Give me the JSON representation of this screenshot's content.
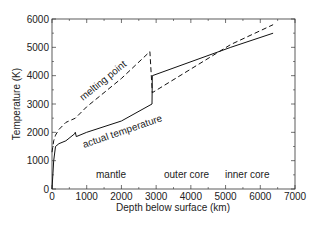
{
  "chart_data": {
    "type": "line",
    "title": "",
    "xlabel": "Depth below surface (km)",
    "ylabel": "Temperature (K)",
    "xlim": [
      0,
      7000
    ],
    "ylim": [
      0,
      6000
    ],
    "xticks": [
      0,
      1000,
      2000,
      3000,
      4000,
      5000,
      6000,
      7000
    ],
    "yticks": [
      0,
      1000,
      2000,
      3000,
      4000,
      5000,
      6000
    ],
    "grid": false,
    "legend": "none",
    "series": [
      {
        "name": "melting point",
        "style": "dashed",
        "x": [
          0,
          50,
          100,
          200,
          400,
          670,
          1000,
          2000,
          2820,
          2890,
          5150,
          6370
        ],
        "y": [
          1300,
          1700,
          1900,
          2100,
          2350,
          2500,
          2900,
          3900,
          4850,
          3400,
          5100,
          5800
        ]
      },
      {
        "name": "actual temperature",
        "style": "solid",
        "x": [
          0,
          50,
          100,
          200,
          400,
          650,
          670,
          700,
          1000,
          2000,
          2880,
          2890,
          5150,
          6370
        ],
        "y": [
          0,
          1000,
          1500,
          1600,
          1700,
          1950,
          2000,
          1850,
          2000,
          2400,
          3000,
          4000,
          5000,
          5500
        ]
      }
    ],
    "annotations": [
      {
        "text": "melting point",
        "x": 1200,
        "y": 3700,
        "rotation": -40
      },
      {
        "text": "actual temperature",
        "x": 1800,
        "y": 2300,
        "rotation": -20
      },
      {
        "text": "mantle",
        "x": 1700,
        "y": 700
      },
      {
        "text": "outer core",
        "x": 4000,
        "y": 700
      },
      {
        "text": "inner core",
        "x": 5700,
        "y": 700
      }
    ]
  },
  "labels": {
    "xlabel": "Depth below surface (km)",
    "ylabel": "Temperature (K)",
    "melting": "melting point",
    "actual": "actual temperature",
    "mantle": "mantle",
    "outer": "outer core",
    "inner": "inner core"
  }
}
